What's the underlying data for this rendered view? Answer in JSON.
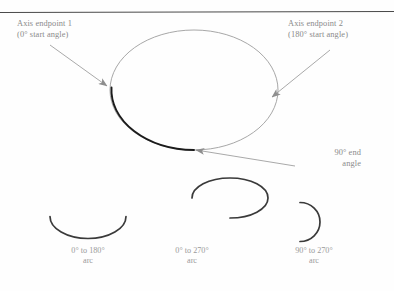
{
  "figure": {
    "type": "technical-illustration",
    "top_rule_color": "#4a4a4a",
    "ellipse_stroke_color": "#9d9d9d",
    "highlight_arc_color": "#1a1a1a",
    "leader_line_color": "#9a9a9a",
    "annotation_text_color": "#8a8a8a",
    "caption_text_color": "#9a9a9a",
    "background_color": "#fefefe"
  },
  "annotations": [
    {
      "id": "endpoint1",
      "line1": "Axis endpoint 1",
      "line2": "(0° start angle)"
    },
    {
      "id": "endpoint2",
      "line1": "Axis endpoint 2",
      "line2": "(180° start angle)"
    },
    {
      "id": "endangle",
      "line1": "90° end",
      "line2": "angle"
    }
  ],
  "arc_examples": [
    {
      "id": "arc-0-180",
      "range_label": "0° to 180°",
      "kind_label": "arc",
      "start_angle": 0,
      "end_angle": 180
    },
    {
      "id": "arc-0-270",
      "range_label": "0° to 270°",
      "kind_label": "arc",
      "start_angle": 0,
      "end_angle": 270
    },
    {
      "id": "arc-90-270",
      "range_label": "90° to 270°",
      "kind_label": "arc",
      "start_angle": 90,
      "end_angle": 270
    }
  ]
}
